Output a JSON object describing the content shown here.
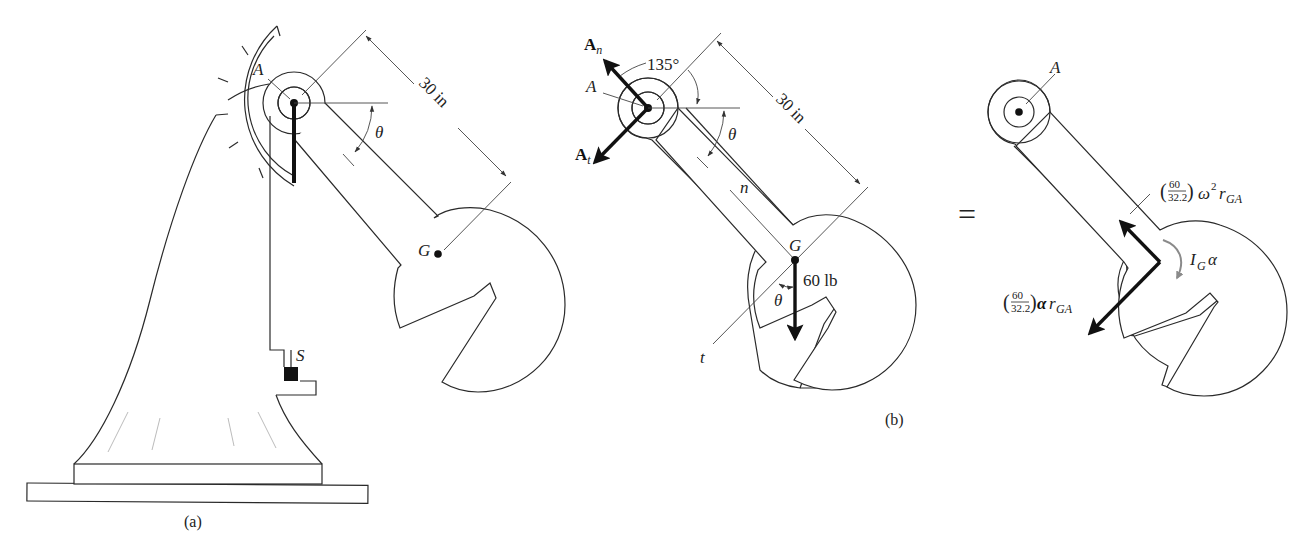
{
  "figure": {
    "panel_a": {
      "caption": "(a)",
      "labels": {
        "pivot": "A",
        "center_of_mass": "G",
        "angle": "θ",
        "spring_stop": "S"
      },
      "dimension": "30 in"
    },
    "panel_b": {
      "caption": "(b)",
      "labels": {
        "pivot": "A",
        "center_of_mass": "G",
        "angle": "θ",
        "angle_at_g": "θ",
        "normal_axis": "n",
        "tangential_axis": "t",
        "normal_force": "A",
        "normal_force_sub": "n",
        "tangential_force": "A",
        "tangential_force_sub": "t"
      },
      "angle_value": "135°",
      "dimension": "30 in",
      "weight": "60 lb"
    },
    "equals_sign": "=",
    "panel_c": {
      "labels": {
        "pivot": "A"
      },
      "normal_inertia_term": {
        "num": "60",
        "den": "32.2",
        "rest": "ω",
        "exp": "2",
        "r": "r",
        "r_sub": "GA"
      },
      "tangential_inertia_term": {
        "num": "60",
        "den": "32.2",
        "rest": "α",
        "r": "r",
        "r_sub": "GA"
      },
      "moment_term": {
        "i": "I",
        "i_sub": "G",
        "alpha": "α"
      }
    }
  }
}
